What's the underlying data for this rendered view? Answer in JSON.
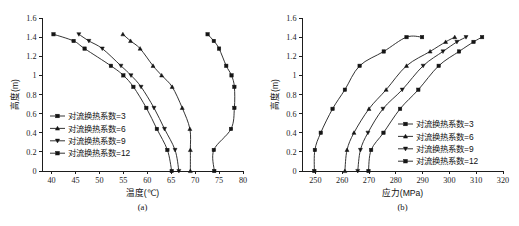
{
  "figure": {
    "panels": [
      {
        "caption": "(a)",
        "xlabel": "温度(℃)",
        "ylabel": "高度(m)",
        "legend_position": "center-left"
      },
      {
        "caption": "(b)",
        "xlabel": "应力(MPa)",
        "ylabel": "高度(m)",
        "legend_position": "center-right"
      }
    ]
  },
  "chart_data": [
    {
      "type": "line",
      "title": "",
      "subtitle": "(a)",
      "xlabel": "温度(℃)",
      "ylabel": "高度(m)",
      "xlim": [
        38,
        80
      ],
      "ylim": [
        0,
        1.6
      ],
      "xticks": [
        40,
        45,
        50,
        55,
        60,
        65,
        70,
        75,
        80
      ],
      "yticks": [
        0,
        0.2,
        0.4,
        0.6,
        0.8,
        1.0,
        1.2,
        1.4,
        1.6
      ],
      "grid": false,
      "legend_position": "center-left",
      "series": [
        {
          "name": "对流换热系数=3",
          "marker": "square",
          "x": [
            74.0,
            73.9,
            77.5,
            78.2,
            78.2,
            77.6,
            76.5,
            75.0,
            73.9,
            72.6
          ],
          "y": [
            0.0,
            0.22,
            0.44,
            0.66,
            0.88,
            1.0,
            1.1,
            1.28,
            1.36,
            1.43
          ]
        },
        {
          "name": "对流换热系数=6",
          "marker": "triangle-up",
          "x": [
            69.0,
            69.0,
            68.9,
            67.3,
            65.2,
            63.0,
            61.2,
            58.5,
            56.5,
            54.9
          ],
          "y": [
            0.0,
            0.22,
            0.44,
            0.66,
            0.88,
            1.0,
            1.1,
            1.28,
            1.36,
            1.43
          ]
        },
        {
          "name": "对流换热系数=9",
          "marker": "triangle-down",
          "x": [
            66.6,
            65.8,
            63.6,
            61.4,
            58.7,
            56.6,
            54.5,
            50.6,
            47.8,
            45.7
          ],
          "y": [
            0.0,
            0.22,
            0.44,
            0.66,
            0.88,
            1.0,
            1.1,
            1.28,
            1.36,
            1.43
          ]
        },
        {
          "name": "对流换热系数=12",
          "marker": "square",
          "x": [
            65.1,
            64.2,
            62.0,
            59.8,
            57.1,
            55.0,
            52.4,
            46.9,
            44.6,
            40.4
          ],
          "y": [
            0.0,
            0.22,
            0.44,
            0.66,
            0.88,
            1.0,
            1.1,
            1.28,
            1.36,
            1.43
          ]
        }
      ]
    },
    {
      "type": "line",
      "title": "",
      "subtitle": "(b)",
      "xlabel": "应力(MPa)",
      "ylabel": "高度(m)",
      "xlim": [
        245,
        320
      ],
      "ylim": [
        0,
        1.6
      ],
      "xticks": [
        250,
        260,
        270,
        280,
        290,
        300,
        310,
        320
      ],
      "yticks": [
        0,
        0.2,
        0.4,
        0.6,
        0.8,
        1.0,
        1.2,
        1.4,
        1.6
      ],
      "grid": false,
      "legend_position": "center-right",
      "series": [
        {
          "name": "对流换热系数=3",
          "marker": "square",
          "x": [
            249.6,
            249.8,
            252.0,
            256.4,
            261.0,
            266.5,
            275.5,
            284.0,
            289.8
          ],
          "y": [
            0.0,
            0.22,
            0.4,
            0.65,
            0.85,
            1.1,
            1.25,
            1.4,
            1.4
          ]
        },
        {
          "name": "对流换热系数=6",
          "marker": "triangle-up",
          "x": [
            261.0,
            261.8,
            264.4,
            270.0,
            276.4,
            284.0,
            292.8,
            298.6,
            302.0
          ],
          "y": [
            0.0,
            0.22,
            0.4,
            0.65,
            0.85,
            1.1,
            1.25,
            1.35,
            1.4
          ]
        },
        {
          "name": "对流换热系数=9",
          "marker": "triangle-down",
          "x": [
            265.8,
            266.8,
            269.6,
            275.2,
            282.4,
            290.2,
            297.6,
            302.8,
            306.2
          ],
          "y": [
            0.0,
            0.22,
            0.4,
            0.65,
            0.85,
            1.1,
            1.25,
            1.35,
            1.4
          ]
        },
        {
          "name": "对流换热系数=12",
          "marker": "square",
          "x": [
            269.8,
            270.8,
            275.4,
            281.6,
            288.4,
            296.0,
            303.6,
            309.0,
            312.2
          ],
          "y": [
            0.0,
            0.22,
            0.4,
            0.65,
            0.85,
            1.1,
            1.25,
            1.35,
            1.4
          ]
        }
      ]
    }
  ]
}
